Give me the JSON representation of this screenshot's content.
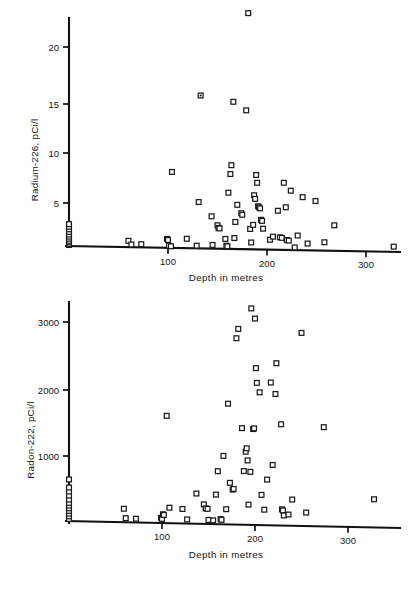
{
  "figure": {
    "background": "#ffffff",
    "ink_color": "#1b1b1b",
    "marker_style": "open-square"
  },
  "chart_data": [
    {
      "id": "radium",
      "type": "scatter",
      "title": "",
      "xlabel": "Depth in metres",
      "ylabel": "Radium-226, pCi/l",
      "xlim": [
        0,
        345
      ],
      "ylim": [
        0,
        24
      ],
      "xticks": [
        100,
        200,
        300
      ],
      "yticks": [
        5,
        10,
        15,
        20
      ],
      "xticklabels": [
        "100",
        "200",
        "300"
      ],
      "yticklabels": [
        "5",
        "10",
        "15",
        "20"
      ],
      "grid": false,
      "legend": false,
      "points": [
        [
          0,
          0.1
        ],
        [
          0,
          0.2
        ],
        [
          0,
          0.35
        ],
        [
          0,
          0.5
        ],
        [
          0,
          0.7
        ],
        [
          0,
          0.9
        ],
        [
          0,
          1.1
        ],
        [
          0,
          1.35
        ],
        [
          0,
          1.6
        ],
        [
          0,
          1.85
        ],
        [
          0,
          2.1
        ],
        [
          60,
          0.6
        ],
        [
          63,
          0.25
        ],
        [
          73,
          0.3
        ],
        [
          99,
          0.85
        ],
        [
          100,
          0.75
        ],
        [
          101,
          0.2
        ],
        [
          103,
          0.15
        ],
        [
          104,
          7.3
        ],
        [
          119,
          0.9
        ],
        [
          129,
          0.25
        ],
        [
          131,
          4.45
        ],
        [
          133,
          14.7
        ],
        [
          144,
          3.1
        ],
        [
          145,
          0.35
        ],
        [
          150,
          2.25
        ],
        [
          151,
          2.0
        ],
        [
          152,
          1.95
        ],
        [
          158,
          0.95
        ],
        [
          159,
          0.3
        ],
        [
          160,
          0.25
        ],
        [
          161,
          5.4
        ],
        [
          163,
          7.2
        ],
        [
          164,
          8.05
        ],
        [
          166,
          14.15
        ],
        [
          167,
          1.05
        ],
        [
          168,
          2.6
        ],
        [
          170,
          4.25
        ],
        [
          174,
          3.45
        ],
        [
          175,
          3.3
        ],
        [
          179,
          13.35
        ],
        [
          181,
          22.7
        ],
        [
          183,
          1.95
        ],
        [
          184,
          0.65
        ],
        [
          186,
          2.35
        ],
        [
          187,
          5.2
        ],
        [
          188,
          4.85
        ],
        [
          189,
          7.15
        ],
        [
          190,
          6.4
        ],
        [
          191,
          4.15
        ],
        [
          192,
          4.05
        ],
        [
          193,
          3.95
        ],
        [
          194,
          2.85
        ],
        [
          195,
          2.75
        ],
        [
          196,
          2.0
        ],
        [
          203,
          0.95
        ],
        [
          206,
          1.25
        ],
        [
          211,
          3.75
        ],
        [
          213,
          1.2
        ],
        [
          215,
          1.15
        ],
        [
          217,
          6.45
        ],
        [
          219,
          4.1
        ],
        [
          220,
          0.95
        ],
        [
          222,
          0.9
        ],
        [
          224,
          5.7
        ],
        [
          228,
          0.25
        ],
        [
          231,
          1.4
        ],
        [
          236,
          5.1
        ],
        [
          241,
          0.65
        ],
        [
          249,
          4.75
        ],
        [
          258,
          0.8
        ],
        [
          268,
          2.45
        ],
        [
          328,
          0.5
        ]
      ]
    },
    {
      "id": "radon",
      "type": "scatter",
      "title": "",
      "xlabel": "Depth in metres",
      "ylabel": "Radon-222, pCi/l",
      "xlim": [
        0,
        345
      ],
      "ylim": [
        0,
        3400
      ],
      "xticks": [
        100,
        200,
        300
      ],
      "yticks": [
        1000,
        2000,
        3000
      ],
      "xticklabels": [
        "100",
        "200",
        "300"
      ],
      "yticklabels": [
        "1000",
        "2000",
        "3000"
      ],
      "grid": false,
      "legend": false,
      "points": [
        [
          0,
          30
        ],
        [
          0,
          70
        ],
        [
          0,
          110
        ],
        [
          0,
          150
        ],
        [
          0,
          190
        ],
        [
          0,
          230
        ],
        [
          0,
          270
        ],
        [
          0,
          320
        ],
        [
          0,
          380
        ],
        [
          0,
          440
        ],
        [
          0,
          500
        ],
        [
          0,
          620
        ],
        [
          59,
          200
        ],
        [
          61,
          60
        ],
        [
          72,
          55
        ],
        [
          99,
          75
        ],
        [
          100,
          60
        ],
        [
          101,
          130
        ],
        [
          102,
          120
        ],
        [
          105,
          1600
        ],
        [
          108,
          230
        ],
        [
          122,
          215
        ],
        [
          127,
          60
        ],
        [
          137,
          450
        ],
        [
          145,
          290
        ],
        [
          147,
          230
        ],
        [
          149,
          225
        ],
        [
          150,
          60
        ],
        [
          155,
          55
        ],
        [
          158,
          440
        ],
        [
          160,
          790
        ],
        [
          163,
          75
        ],
        [
          164,
          65
        ],
        [
          166,
          1020
        ],
        [
          169,
          225
        ],
        [
          171,
          1800
        ],
        [
          173,
          620
        ],
        [
          176,
          520
        ],
        [
          177,
          530
        ],
        [
          180,
          2780
        ],
        [
          182,
          2920
        ],
        [
          186,
          1440
        ],
        [
          188,
          800
        ],
        [
          190,
          1090
        ],
        [
          191,
          1140
        ],
        [
          192,
          960
        ],
        [
          193,
          300
        ],
        [
          195,
          790
        ],
        [
          196,
          3230
        ],
        [
          198,
          1430
        ],
        [
          199,
          1440
        ],
        [
          200,
          3080
        ],
        [
          201,
          2340
        ],
        [
          202,
          2120
        ],
        [
          205,
          1980
        ],
        [
          207,
          450
        ],
        [
          210,
          230
        ],
        [
          213,
          680
        ],
        [
          217,
          2130
        ],
        [
          219,
          900
        ],
        [
          222,
          1960
        ],
        [
          223,
          2420
        ],
        [
          228,
          1510
        ],
        [
          229,
          240
        ],
        [
          230,
          225
        ],
        [
          231,
          150
        ],
        [
          236,
          165
        ],
        [
          240,
          390
        ],
        [
          250,
          2880
        ],
        [
          255,
          200
        ],
        [
          274,
          1480
        ],
        [
          328,
          420
        ]
      ],
      "special_markers": [
        {
          "x": 199,
          "y": 1440,
          "style": "filled"
        }
      ]
    }
  ],
  "labels": {
    "depth_axis": "Depth in metres",
    "radium_axis": "Radium-226, pCi/l",
    "radon_axis": "Radon-222, pCi/l"
  }
}
